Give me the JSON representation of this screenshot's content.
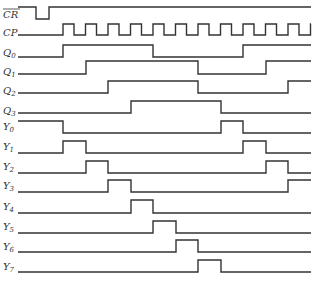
{
  "diagram": {
    "type": "timing-diagram",
    "title": "",
    "x_start": 18,
    "x_end": 311,
    "clock_edges": [
      63,
      86,
      108,
      131,
      153,
      176,
      198,
      221,
      243,
      266,
      288,
      311
    ],
    "signals": [
      {
        "name": "CR",
        "overbar": true,
        "label_y": 18,
        "high_y": 7,
        "low_y": 19,
        "initial": 1,
        "transitions": [
          36,
          49
        ]
      },
      {
        "name": "CP",
        "overbar": false,
        "label_y": 36,
        "high_y": 24,
        "low_y": 35,
        "initial": 0,
        "clock": true,
        "rise_start": 63,
        "period": 22.5,
        "high_width": 11
      },
      {
        "name": "Q",
        "sub": "0",
        "label_y": 56,
        "high_y": 45,
        "low_y": 57,
        "initial": 0,
        "transitions": [
          63,
          153,
          243
        ]
      },
      {
        "name": "Q",
        "sub": "1",
        "label_y": 75,
        "high_y": 61,
        "low_y": 74,
        "initial": 0,
        "transitions": [
          86,
          198,
          266
        ]
      },
      {
        "name": "Q",
        "sub": "2",
        "label_y": 94,
        "high_y": 81,
        "low_y": 93,
        "initial": 0,
        "transitions": [
          108,
          198,
          288
        ]
      },
      {
        "name": "Q",
        "sub": "3",
        "label_y": 114,
        "high_y": 101,
        "low_y": 113,
        "initial": 0,
        "transitions": [
          131,
          221
        ]
      },
      {
        "name": "Y",
        "sub": "0",
        "label_y": 130,
        "high_y": 121,
        "low_y": 133,
        "initial": 1,
        "transitions": [
          63,
          221,
          243
        ]
      },
      {
        "name": "Y",
        "sub": "1",
        "label_y": 150,
        "high_y": 141,
        "low_y": 153,
        "initial": 0,
        "transitions": [
          63,
          86,
          243,
          266
        ]
      },
      {
        "name": "Y",
        "sub": "2",
        "label_y": 170,
        "high_y": 161,
        "low_y": 173,
        "initial": 0,
        "transitions": [
          86,
          108,
          266,
          288
        ]
      },
      {
        "name": "Y",
        "sub": "3",
        "label_y": 189,
        "high_y": 180,
        "low_y": 192,
        "initial": 0,
        "transitions": [
          108,
          131,
          288
        ]
      },
      {
        "name": "Y",
        "sub": "4",
        "label_y": 210,
        "high_y": 200,
        "low_y": 213,
        "initial": 0,
        "transitions": [
          131,
          153
        ]
      },
      {
        "name": "Y",
        "sub": "5",
        "label_y": 230,
        "high_y": 221,
        "low_y": 233,
        "initial": 0,
        "transitions": [
          153,
          176
        ]
      },
      {
        "name": "Y",
        "sub": "6",
        "label_y": 250,
        "high_y": 240,
        "low_y": 252,
        "initial": 0,
        "transitions": [
          176,
          198
        ]
      },
      {
        "name": "Y",
        "sub": "7",
        "label_y": 270,
        "high_y": 260,
        "low_y": 272,
        "initial": 0,
        "transitions": [
          198,
          221
        ]
      }
    ]
  }
}
